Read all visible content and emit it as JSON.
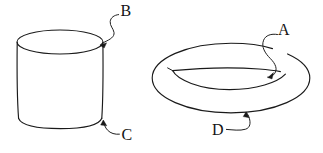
{
  "figure": {
    "title": "Cylinder and torus line diagram",
    "background_color": "#ffffff",
    "stroke_color": "#1a1a1a",
    "width": 323,
    "height": 153,
    "shapes": [
      {
        "id": "cylinder",
        "name": "cylinder",
        "description": "Open-ended cylinder drawn with an elliptical top rim and a curved bottom edge",
        "top_ellipse": {
          "cx": 60,
          "cy": 42,
          "rx": 43,
          "ry": 12
        },
        "left_side_x": 17,
        "right_side_x": 103,
        "bottom_y": 128
      },
      {
        "id": "torus",
        "name": "torus",
        "description": "Torus (doughnut) drawn with an outer ellipse and an inner lens-shaped hole",
        "outer_ellipse": {
          "cx": 231,
          "cy": 78,
          "rx": 79,
          "ry": 35
        },
        "inner_hole": {
          "cx": 229,
          "cy": 79,
          "rx": 57,
          "ry": 11
        }
      }
    ],
    "labels": [
      {
        "id": "label-a",
        "text": "A",
        "x": 284,
        "y": 31,
        "points_to": "torus inner tube surface",
        "arrow_target": {
          "x": 267,
          "y": 77
        }
      },
      {
        "id": "label-b",
        "text": "B",
        "x": 126,
        "y": 12,
        "points_to": "cylinder top rim",
        "arrow_target": {
          "x": 100,
          "y": 45
        }
      },
      {
        "id": "label-c",
        "text": "C",
        "x": 127,
        "y": 136,
        "points_to": "cylinder bottom edge",
        "arrow_target": {
          "x": 103,
          "y": 120
        }
      },
      {
        "id": "label-d",
        "text": "D",
        "x": 218,
        "y": 131,
        "points_to": "torus outer bottom edge",
        "arrow_target": {
          "x": 246,
          "y": 112
        }
      }
    ]
  }
}
